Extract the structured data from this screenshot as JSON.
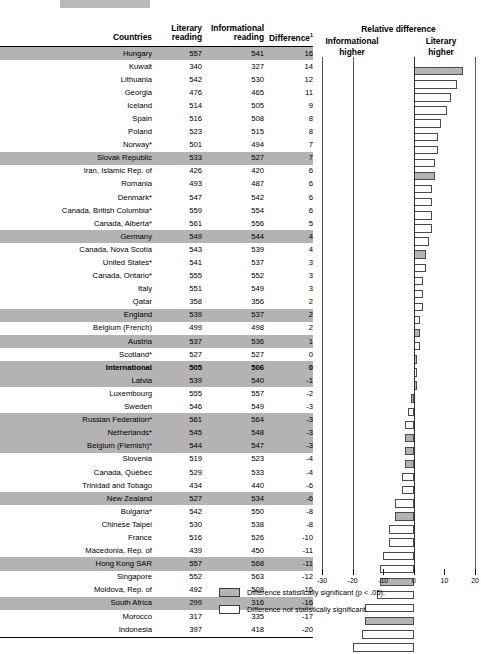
{
  "table": {
    "headers": {
      "countries": "Countries",
      "literary": "Literary reading",
      "literary_l1": "Literary",
      "literary_l2": "reading",
      "informational": "Informational reading",
      "informational_l1": "Informational",
      "informational_l2": "reading",
      "difference": "Difference",
      "difference_sup": "1"
    },
    "rows": [
      {
        "country": "Hungary",
        "literary": 557,
        "informational": 541,
        "difference": 16,
        "significant": true,
        "bold": false
      },
      {
        "country": "Kuwait",
        "literary": 340,
        "informational": 327,
        "difference": 14,
        "significant": false,
        "bold": false
      },
      {
        "country": "Lithuania",
        "literary": 542,
        "informational": 530,
        "difference": 12,
        "significant": false,
        "bold": false
      },
      {
        "country": "Georgia",
        "literary": 476,
        "informational": 465,
        "difference": 11,
        "significant": false,
        "bold": false
      },
      {
        "country": "Iceland",
        "literary": 514,
        "informational": 505,
        "difference": 9,
        "significant": false,
        "bold": false
      },
      {
        "country": "Spain",
        "literary": 516,
        "informational": 508,
        "difference": 8,
        "significant": false,
        "bold": false
      },
      {
        "country": "Poland",
        "literary": 523,
        "informational": 515,
        "difference": 8,
        "significant": false,
        "bold": false
      },
      {
        "country": "Norway*",
        "literary": 501,
        "informational": 494,
        "difference": 7,
        "significant": false,
        "bold": false
      },
      {
        "country": "Slovak Republic",
        "literary": 533,
        "informational": 527,
        "difference": 7,
        "significant": true,
        "bold": false
      },
      {
        "country": "Iran, Islamic Rep. of",
        "literary": 426,
        "informational": 420,
        "difference": 6,
        "significant": false,
        "bold": false
      },
      {
        "country": "Romania",
        "literary": 493,
        "informational": 487,
        "difference": 6,
        "significant": false,
        "bold": false
      },
      {
        "country": "Denmark*",
        "literary": 547,
        "informational": 542,
        "difference": 6,
        "significant": false,
        "bold": false
      },
      {
        "country": "Canada, British Columbia*",
        "literary": 559,
        "informational": 554,
        "difference": 6,
        "significant": false,
        "bold": false
      },
      {
        "country": "Canada, Alberta*",
        "literary": 561,
        "informational": 556,
        "difference": 5,
        "significant": false,
        "bold": false
      },
      {
        "country": "Germany",
        "literary": 549,
        "informational": 544,
        "difference": 4,
        "significant": true,
        "bold": false
      },
      {
        "country": "Canada, Nova Scotia",
        "literary": 543,
        "informational": 539,
        "difference": 4,
        "significant": false,
        "bold": false
      },
      {
        "country": "United States*",
        "literary": 541,
        "informational": 537,
        "difference": 3,
        "significant": false,
        "bold": false
      },
      {
        "country": "Canada, Ontario*",
        "literary": 555,
        "informational": 552,
        "difference": 3,
        "significant": false,
        "bold": false
      },
      {
        "country": "Italy",
        "literary": 551,
        "informational": 549,
        "difference": 3,
        "significant": false,
        "bold": false
      },
      {
        "country": "Qatar",
        "literary": 358,
        "informational": 356,
        "difference": 2,
        "significant": false,
        "bold": false
      },
      {
        "country": "England",
        "literary": 539,
        "informational": 537,
        "difference": 2,
        "significant": true,
        "bold": false
      },
      {
        "country": "Belgium (French)",
        "literary": 499,
        "informational": 498,
        "difference": 2,
        "significant": false,
        "bold": false
      },
      {
        "country": "Austria",
        "literary": 537,
        "informational": 536,
        "difference": 1,
        "significant": true,
        "bold": false
      },
      {
        "country": "Scotland*",
        "literary": 527,
        "informational": 527,
        "difference": 0,
        "significant": false,
        "bold": false
      },
      {
        "country": "International",
        "literary": 505,
        "informational": 506,
        "difference": 0,
        "significant": true,
        "bold": true
      },
      {
        "country": "Latvia",
        "literary": 539,
        "informational": 540,
        "difference": -1,
        "significant": true,
        "bold": false
      },
      {
        "country": "Luxembourg",
        "literary": 555,
        "informational": 557,
        "difference": -2,
        "significant": false,
        "bold": false
      },
      {
        "country": "Sweden",
        "literary": 546,
        "informational": 549,
        "difference": -3,
        "significant": false,
        "bold": false
      },
      {
        "country": "Russian Federation*",
        "literary": 561,
        "informational": 564,
        "difference": -3,
        "significant": true,
        "bold": false
      },
      {
        "country": "Netherlands*",
        "literary": 545,
        "informational": 548,
        "difference": -3,
        "significant": true,
        "bold": false
      },
      {
        "country": "Belgium (Flemish)*",
        "literary": 544,
        "informational": 547,
        "difference": -3,
        "significant": true,
        "bold": false
      },
      {
        "country": "Slovenia",
        "literary": 519,
        "informational": 523,
        "difference": -4,
        "significant": false,
        "bold": false
      },
      {
        "country": "Canada, Québec",
        "literary": 529,
        "informational": 533,
        "difference": -4,
        "significant": false,
        "bold": false
      },
      {
        "country": "Trinidad and Tobago",
        "literary": 434,
        "informational": 440,
        "difference": -6,
        "significant": false,
        "bold": false
      },
      {
        "country": "New Zealand",
        "literary": 527,
        "informational": 534,
        "difference": -6,
        "significant": true,
        "bold": false
      },
      {
        "country": "Bulgaria*",
        "literary": 542,
        "informational": 550,
        "difference": -8,
        "significant": false,
        "bold": false
      },
      {
        "country": "Chinese Taipei",
        "literary": 530,
        "informational": 538,
        "difference": -8,
        "significant": false,
        "bold": false
      },
      {
        "country": "France",
        "literary": 516,
        "informational": 526,
        "difference": -10,
        "significant": false,
        "bold": false
      },
      {
        "country": "Macedonia, Rep. of",
        "literary": 439,
        "informational": 450,
        "difference": -11,
        "significant": false,
        "bold": false
      },
      {
        "country": "Hong Kong SAR",
        "literary": 557,
        "informational": 568,
        "difference": -11,
        "significant": true,
        "bold": false
      },
      {
        "country": "Singapore",
        "literary": 552,
        "informational": 563,
        "difference": -12,
        "significant": false,
        "bold": false
      },
      {
        "country": "Moldova, Rep. of",
        "literary": 492,
        "informational": 508,
        "difference": -16,
        "significant": false,
        "bold": false
      },
      {
        "country": "South Africa",
        "literary": 299,
        "informational": 316,
        "difference": -16,
        "significant": true,
        "bold": false
      },
      {
        "country": "Morocco",
        "literary": 317,
        "informational": 335,
        "difference": -17,
        "significant": false,
        "bold": false
      },
      {
        "country": "Indonesia",
        "literary": 397,
        "informational": 418,
        "difference": -20,
        "significant": false,
        "bold": false
      }
    ]
  },
  "chart_data": {
    "type": "bar",
    "orientation": "horizontal",
    "title": "Relative difference",
    "subtitle_left": "Informational higher",
    "subtitle_right": "Literary higher",
    "xlabel": "",
    "ylabel": "",
    "xlim": [
      -30,
      20
    ],
    "xticks": [
      -30,
      -20,
      -10,
      0,
      10,
      20
    ],
    "xticklabels": [
      "-30",
      "-20",
      "-10",
      "0",
      "10",
      "20"
    ],
    "grid": false,
    "zero_line": 0,
    "categories": [
      "Hungary",
      "Kuwait",
      "Lithuania",
      "Georgia",
      "Iceland",
      "Spain",
      "Poland",
      "Norway*",
      "Slovak Republic",
      "Iran, Islamic Rep. of",
      "Romania",
      "Denmark*",
      "Canada, British Columbia*",
      "Canada, Alberta*",
      "Germany",
      "Canada, Nova Scotia",
      "United States*",
      "Canada, Ontario*",
      "Italy",
      "Qatar",
      "England",
      "Belgium (French)",
      "Austria",
      "Scotland*",
      "International",
      "Latvia",
      "Luxembourg",
      "Sweden",
      "Russian Federation*",
      "Netherlands*",
      "Belgium (Flemish)*",
      "Slovenia",
      "Canada, Québec",
      "Trinidad and Tobago",
      "New Zealand",
      "Bulgaria*",
      "Chinese Taipei",
      "France",
      "Macedonia, Rep. of",
      "Hong Kong SAR",
      "Singapore",
      "Moldova, Rep. of",
      "South Africa",
      "Morocco",
      "Indonesia"
    ],
    "values": [
      16,
      14,
      12,
      11,
      9,
      8,
      8,
      7,
      7,
      6,
      6,
      6,
      6,
      5,
      4,
      4,
      3,
      3,
      3,
      2,
      2,
      2,
      1,
      0,
      0,
      -1,
      -2,
      -3,
      -3,
      -3,
      -3,
      -4,
      -4,
      -6,
      -6,
      -8,
      -8,
      -10,
      -11,
      -11,
      -12,
      -16,
      -16,
      -17,
      -20
    ],
    "significant": [
      true,
      false,
      false,
      false,
      false,
      false,
      false,
      false,
      true,
      false,
      false,
      false,
      false,
      false,
      true,
      false,
      false,
      false,
      false,
      false,
      true,
      false,
      true,
      false,
      true,
      true,
      false,
      false,
      true,
      true,
      true,
      false,
      false,
      false,
      true,
      false,
      false,
      false,
      false,
      true,
      false,
      false,
      true,
      false,
      false
    ],
    "colors": {
      "significant_fill": "#b3b3b3",
      "not_significant_fill": "#ffffff",
      "bar_edge": "#4a4a4a"
    }
  },
  "legend": {
    "items": [
      {
        "label": "Difference statistically significant (p < .05).",
        "fill": "significant"
      },
      {
        "label": "Difference not statistically significant.",
        "fill": "not-significant"
      }
    ]
  }
}
